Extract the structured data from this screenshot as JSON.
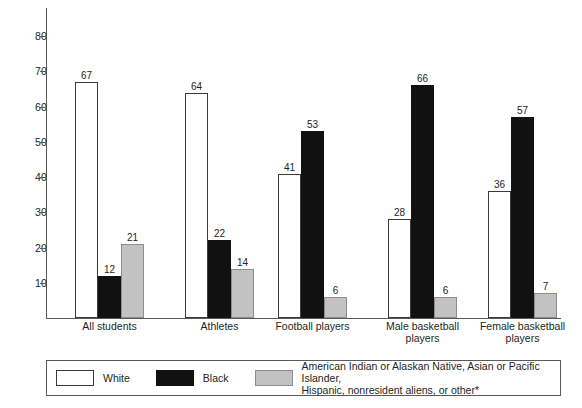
{
  "chart_data": {
    "type": "bar",
    "title": "",
    "subtitle": "",
    "xlabel": "",
    "ylabel": "",
    "ylim": [
      0,
      88
    ],
    "yticks": [
      10,
      20,
      30,
      40,
      50,
      60,
      70,
      80
    ],
    "ytick_labels": [
      "10",
      "20",
      "30",
      "40",
      "50",
      "60",
      "70",
      "80"
    ],
    "grid": false,
    "legend_position": "bottom",
    "categories": [
      "All students",
      "Athletes",
      "Football players",
      "Male basketball players",
      "Female basketball players"
    ],
    "category_lines": [
      [
        "All students"
      ],
      [
        "Athletes"
      ],
      [
        "Football players"
      ],
      [
        "Male basketball",
        "players"
      ],
      [
        "Female basketball",
        "players"
      ]
    ],
    "series": [
      {
        "name": "White",
        "color": "#ffffff",
        "values": [
          67,
          64,
          41,
          28,
          36
        ]
      },
      {
        "name": "Black",
        "color": "#111111",
        "values": [
          12,
          22,
          53,
          66,
          57
        ]
      },
      {
        "name": "American Indian or Alaskan Native, Asian or Pacific Islander, Hispanic, nonresident aliens, or other*",
        "color": "#c2c2c2",
        "values": [
          21,
          14,
          6,
          6,
          7
        ]
      }
    ],
    "annotations": []
  },
  "legend": {
    "items": [
      {
        "label": "White",
        "swatch": "white"
      },
      {
        "label": "Black",
        "swatch": "black"
      },
      {
        "label_line1": "American Indian or Alaskan Native, Asian or Pacific Islander,",
        "label_line2": "Hispanic, nonresident aliens, or other*",
        "swatch": "gray"
      }
    ]
  },
  "colors": {
    "white_bar": "#ffffff",
    "black_bar": "#111111",
    "gray_bar": "#c2c2c2",
    "axis": "#58595b",
    "text": "#231f20"
  }
}
